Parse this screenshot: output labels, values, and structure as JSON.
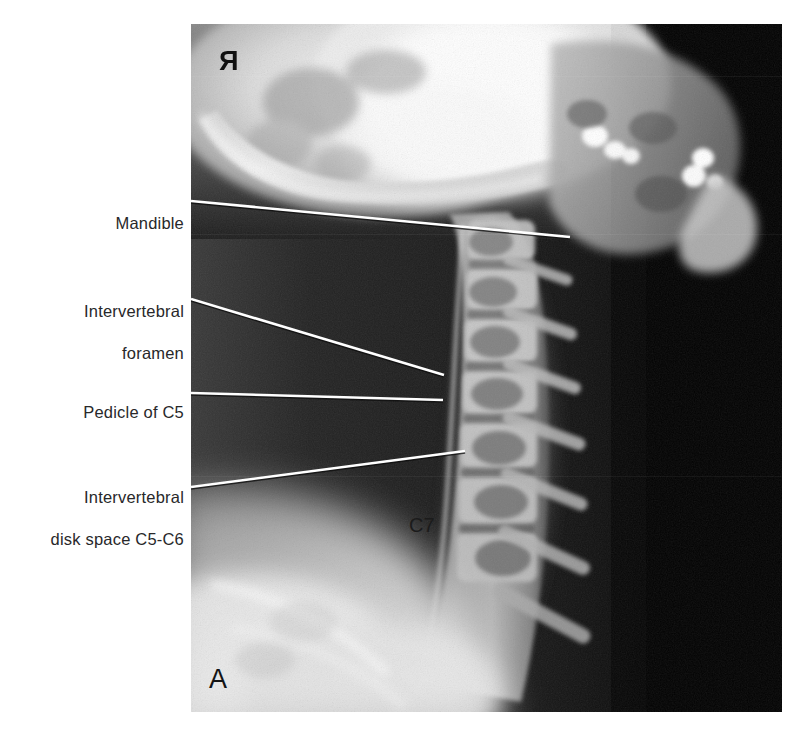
{
  "figure": {
    "panel_letter": "A",
    "modality": "lateral cervical spine radiograph",
    "side_marker": "R",
    "in_image_labels": [
      {
        "name": "c7-vertebra-label",
        "text": "C7"
      }
    ]
  },
  "annotations": [
    {
      "id": "mandible",
      "line1": "Mandible",
      "line2": "",
      "leader": {
        "x1": 0,
        "y1": 178,
        "x2": 379,
        "y2": 214
      }
    },
    {
      "id": "intervertebral-foramen",
      "line1": "Intervertebral",
      "line2": "foramen",
      "leader": {
        "x1": 0,
        "y1": 276,
        "x2": 253,
        "y2": 352
      }
    },
    {
      "id": "pedicle-of-c5",
      "line1": "Pedicle of C5",
      "line2": "",
      "leader": {
        "x1": 0,
        "y1": 370,
        "x2": 252,
        "y2": 377
      }
    },
    {
      "id": "intervertebral-disk-space",
      "line1": "Intervertebral",
      "line2": "disk space C5-C6",
      "leader": {
        "x1": 0,
        "y1": 463,
        "x2": 274,
        "y2": 427
      }
    }
  ],
  "colors": {
    "leader_line": "#ffffff",
    "label_text": "#28282a",
    "film_background": "#050505",
    "page_background": "#ffffff"
  }
}
